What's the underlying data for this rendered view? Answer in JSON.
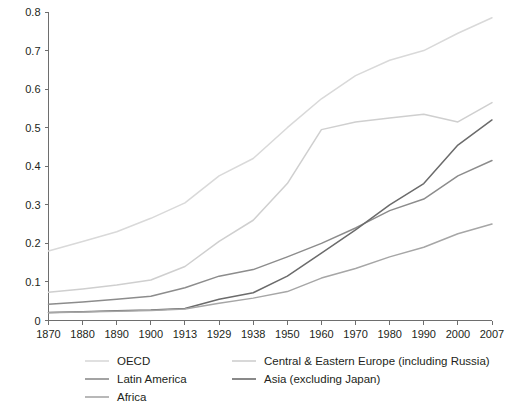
{
  "chart_data": {
    "type": "line",
    "title": "",
    "subtitle": "",
    "xlabel": "",
    "ylabel": "",
    "grid": false,
    "legend_position": "bottom",
    "categories": [
      "1870",
      "1880",
      "1890",
      "1900",
      "1913",
      "1929",
      "1938",
      "1950",
      "1960",
      "1970",
      "1980",
      "1990",
      "2000",
      "2007"
    ],
    "ylim": [
      0,
      0.8
    ],
    "ytick_labels": [
      "0",
      "0.1",
      "0.2",
      "0.3",
      "0.4",
      "0.5",
      "0.6",
      "0.7",
      "0.8"
    ],
    "ytick_values": [
      0,
      0.1,
      0.2,
      0.3,
      0.4,
      0.5,
      0.6,
      0.7,
      0.8
    ],
    "series": [
      {
        "name": "OECD",
        "color": "#d9d9d9",
        "values": [
          0.18,
          0.205,
          0.23,
          0.265,
          0.305,
          0.375,
          0.42,
          0.5,
          0.575,
          0.635,
          0.675,
          0.7,
          0.745,
          0.785
        ]
      },
      {
        "name": "Central & Eastern Europe (including Russia)",
        "color": "#cfcfcf",
        "values": [
          0.073,
          0.082,
          0.092,
          0.105,
          0.14,
          0.205,
          0.26,
          0.355,
          0.495,
          0.515,
          0.525,
          0.535,
          0.515,
          0.565
        ]
      },
      {
        "name": "Latin America",
        "color": "#8c8c8c",
        "values": [
          0.042,
          0.048,
          0.055,
          0.063,
          0.085,
          0.115,
          0.132,
          0.165,
          0.2,
          0.24,
          0.285,
          0.315,
          0.375,
          0.415
        ]
      },
      {
        "name": "Asia (excluding Japan)",
        "color": "#6b6b6b",
        "values": [
          0.021,
          0.023,
          0.025,
          0.027,
          0.031,
          0.055,
          0.072,
          0.115,
          0.175,
          0.235,
          0.3,
          0.355,
          0.455,
          0.52
        ]
      },
      {
        "name": "Africa",
        "color": "#a6a6a6",
        "values": [
          0.02,
          0.022,
          0.024,
          0.026,
          0.03,
          0.045,
          0.058,
          0.075,
          0.11,
          0.135,
          0.165,
          0.19,
          0.225,
          0.25
        ]
      }
    ],
    "legend": [
      {
        "label": "OECD",
        "color": "#d9d9d9"
      },
      {
        "label": "Central & Eastern Europe (including Russia)",
        "color": "#cfcfcf"
      },
      {
        "label": "Latin America",
        "color": "#8c8c8c"
      },
      {
        "label": "Asia (excluding Japan)",
        "color": "#6b6b6b"
      },
      {
        "label": "Africa",
        "color": "#a6a6a6"
      }
    ]
  }
}
